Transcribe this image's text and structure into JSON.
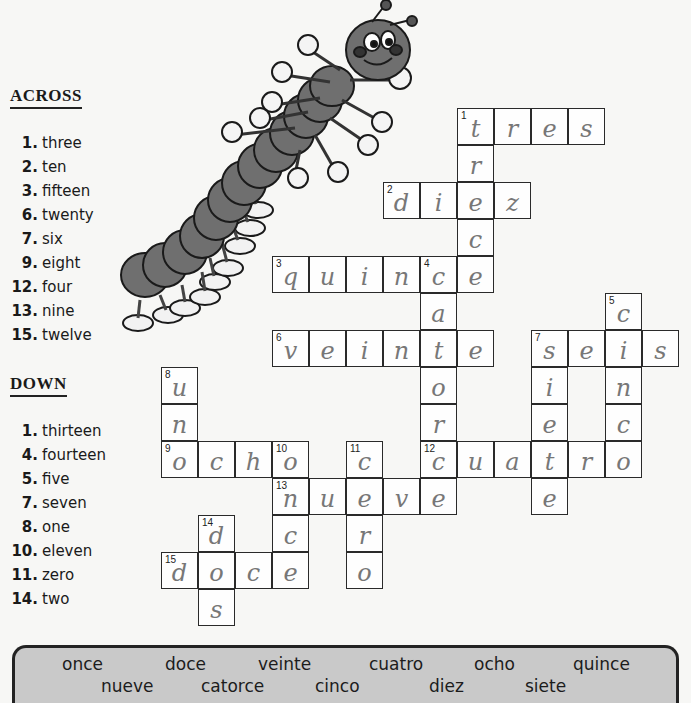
{
  "across": {
    "title": "ACROSS",
    "clues": [
      {
        "num": "1.",
        "text": "three"
      },
      {
        "num": "2.",
        "text": "ten"
      },
      {
        "num": "3.",
        "text": "fifteen"
      },
      {
        "num": "6.",
        "text": "twenty"
      },
      {
        "num": "7.",
        "text": "six"
      },
      {
        "num": "9.",
        "text": "eight"
      },
      {
        "num": "12.",
        "text": "four"
      },
      {
        "num": "13.",
        "text": "nine"
      },
      {
        "num": "15.",
        "text": "twelve"
      }
    ]
  },
  "down": {
    "title": "DOWN",
    "clues": [
      {
        "num": "1.",
        "text": "thirteen"
      },
      {
        "num": "4.",
        "text": "fourteen"
      },
      {
        "num": "5.",
        "text": "five"
      },
      {
        "num": "7.",
        "text": "seven"
      },
      {
        "num": "8.",
        "text": "one"
      },
      {
        "num": "10.",
        "text": "eleven"
      },
      {
        "num": "11.",
        "text": "zero"
      },
      {
        "num": "14.",
        "text": "two"
      }
    ]
  },
  "grid": {
    "cell_size": 37,
    "cells": [
      {
        "r": 0,
        "c": 8,
        "n": "1",
        "ch": "t"
      },
      {
        "r": 0,
        "c": 9,
        "ch": "r"
      },
      {
        "r": 0,
        "c": 10,
        "ch": "e"
      },
      {
        "r": 0,
        "c": 11,
        "ch": "s"
      },
      {
        "r": 1,
        "c": 8,
        "ch": "r"
      },
      {
        "r": 2,
        "c": 6,
        "n": "2",
        "ch": "d"
      },
      {
        "r": 2,
        "c": 7,
        "ch": "i"
      },
      {
        "r": 2,
        "c": 8,
        "ch": "e"
      },
      {
        "r": 2,
        "c": 9,
        "ch": "z"
      },
      {
        "r": 3,
        "c": 8,
        "ch": "c"
      },
      {
        "r": 4,
        "c": 3,
        "n": "3",
        "ch": "q"
      },
      {
        "r": 4,
        "c": 4,
        "ch": "u"
      },
      {
        "r": 4,
        "c": 5,
        "ch": "i"
      },
      {
        "r": 4,
        "c": 6,
        "ch": "n"
      },
      {
        "r": 4,
        "c": 7,
        "n": "4",
        "ch": "c"
      },
      {
        "r": 4,
        "c": 8,
        "ch": "e"
      },
      {
        "r": 5,
        "c": 7,
        "ch": "a"
      },
      {
        "r": 5,
        "c": 12,
        "n": "5",
        "ch": "c"
      },
      {
        "r": 6,
        "c": 3,
        "n": "6",
        "ch": "v"
      },
      {
        "r": 6,
        "c": 4,
        "ch": "e"
      },
      {
        "r": 6,
        "c": 5,
        "ch": "i"
      },
      {
        "r": 6,
        "c": 6,
        "ch": "n"
      },
      {
        "r": 6,
        "c": 7,
        "ch": "t"
      },
      {
        "r": 6,
        "c": 8,
        "ch": "e"
      },
      {
        "r": 6,
        "c": 10,
        "n": "7",
        "ch": "s"
      },
      {
        "r": 6,
        "c": 11,
        "ch": "e"
      },
      {
        "r": 6,
        "c": 12,
        "ch": "i"
      },
      {
        "r": 6,
        "c": 13,
        "ch": "s"
      },
      {
        "r": 7,
        "c": 0,
        "n": "8",
        "ch": "u"
      },
      {
        "r": 7,
        "c": 7,
        "ch": "o"
      },
      {
        "r": 7,
        "c": 10,
        "ch": "i"
      },
      {
        "r": 7,
        "c": 12,
        "ch": "n"
      },
      {
        "r": 8,
        "c": 0,
        "ch": "n"
      },
      {
        "r": 8,
        "c": 7,
        "ch": "r"
      },
      {
        "r": 8,
        "c": 10,
        "ch": "e"
      },
      {
        "r": 8,
        "c": 12,
        "ch": "c"
      },
      {
        "r": 9,
        "c": 0,
        "n": "9",
        "ch": "o"
      },
      {
        "r": 9,
        "c": 1,
        "ch": "c"
      },
      {
        "r": 9,
        "c": 2,
        "ch": "h"
      },
      {
        "r": 9,
        "c": 3,
        "n": "10",
        "ch": "o"
      },
      {
        "r": 9,
        "c": 5,
        "n": "11",
        "ch": "c"
      },
      {
        "r": 9,
        "c": 7,
        "n": "12",
        "ch": "c"
      },
      {
        "r": 9,
        "c": 8,
        "ch": "u"
      },
      {
        "r": 9,
        "c": 9,
        "ch": "a"
      },
      {
        "r": 9,
        "c": 10,
        "ch": "t"
      },
      {
        "r": 9,
        "c": 11,
        "ch": "r"
      },
      {
        "r": 9,
        "c": 12,
        "ch": "o"
      },
      {
        "r": 10,
        "c": 3,
        "n": "13",
        "ch": "n"
      },
      {
        "r": 10,
        "c": 4,
        "ch": "u"
      },
      {
        "r": 10,
        "c": 5,
        "ch": "e"
      },
      {
        "r": 10,
        "c": 6,
        "ch": "v"
      },
      {
        "r": 10,
        "c": 7,
        "ch": "e"
      },
      {
        "r": 10,
        "c": 10,
        "ch": "e"
      },
      {
        "r": 11,
        "c": 1,
        "n": "14",
        "ch": "d"
      },
      {
        "r": 11,
        "c": 3,
        "ch": "c"
      },
      {
        "r": 11,
        "c": 5,
        "ch": "r"
      },
      {
        "r": 12,
        "c": 0,
        "n": "15",
        "ch": "d"
      },
      {
        "r": 12,
        "c": 1,
        "ch": "o"
      },
      {
        "r": 12,
        "c": 2,
        "ch": "c"
      },
      {
        "r": 12,
        "c": 3,
        "ch": "e"
      },
      {
        "r": 12,
        "c": 5,
        "ch": "o"
      },
      {
        "r": 13,
        "c": 1,
        "ch": "s"
      }
    ]
  },
  "word_bank": {
    "row1": [
      "once",
      "doce",
      "veinte",
      "cuatro",
      "ocho",
      "quince"
    ],
    "row2": [
      "nueve",
      "catorce",
      "cinco",
      "diez",
      "siete"
    ]
  },
  "illustration": {
    "subject": "cartoon centipede holding up fingers"
  }
}
